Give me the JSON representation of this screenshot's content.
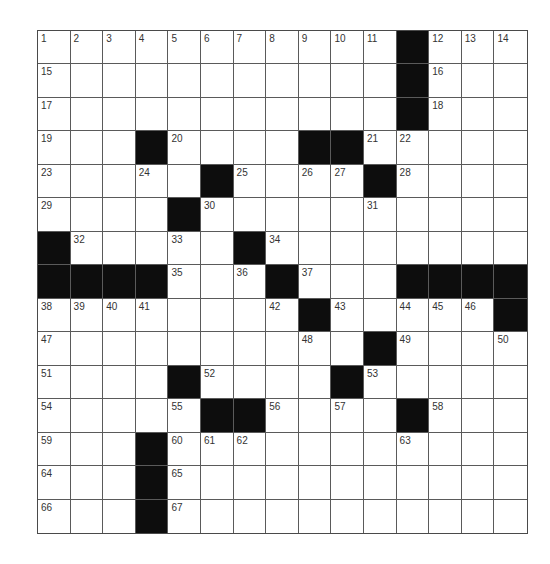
{
  "puzzle": {
    "rows": 15,
    "cols": 15,
    "colors": {
      "block": "#0d0d0d",
      "cell": "#ffffff",
      "line": "#5a5a5a",
      "number": "#333333"
    },
    "grid": [
      [
        "1",
        "2",
        "3",
        "4",
        "5",
        "6",
        "7",
        "8",
        "9",
        "10",
        "11",
        "#",
        "12",
        "13",
        "14"
      ],
      [
        "15",
        "",
        "",
        "",
        "",
        "",
        "",
        "",
        "",
        "",
        "",
        "#",
        "16",
        "",
        ""
      ],
      [
        "17",
        "",
        "",
        "",
        "",
        "",
        "",
        "",
        "",
        "",
        "",
        "#",
        "18",
        "",
        ""
      ],
      [
        "19",
        "",
        "",
        "#",
        "20",
        "",
        "",
        "",
        "#",
        "#",
        "21",
        "22",
        "",
        "",
        ""
      ],
      [
        "23",
        "",
        "",
        "24",
        "",
        "#",
        "25",
        "",
        "26",
        "27",
        "#",
        "28",
        "",
        "",
        ""
      ],
      [
        "29",
        "",
        "",
        "",
        "#",
        "30",
        "",
        "",
        "",
        "",
        "31",
        "",
        "",
        "",
        ""
      ],
      [
        "#",
        "32",
        "",
        "",
        "33",
        "",
        "#",
        "34",
        "",
        "",
        "",
        "",
        "",
        "",
        ""
      ],
      [
        "#",
        "#",
        "#",
        "#",
        "35",
        "",
        "36",
        "#",
        "37",
        "",
        "",
        "#",
        "#",
        "#",
        "#"
      ],
      [
        "38",
        "39",
        "40",
        "41",
        "",
        "",
        "",
        "42",
        "#",
        "43",
        "",
        "44",
        "45",
        "46",
        "#"
      ],
      [
        "47",
        "",
        "",
        "",
        "",
        "",
        "",
        "",
        "48",
        "",
        "#",
        "49",
        "",
        "",
        "50"
      ],
      [
        "51",
        "",
        "",
        "",
        "#",
        "52",
        "",
        "",
        "",
        "#",
        "53",
        "",
        "",
        "",
        ""
      ],
      [
        "54",
        "",
        "",
        "",
        "55",
        "#",
        "#",
        "56",
        "",
        "57",
        "",
        "#",
        "58",
        "",
        ""
      ],
      [
        "59",
        "",
        "",
        "#",
        "60",
        "61",
        "62",
        "",
        "",
        "",
        "",
        "63",
        "",
        "",
        ""
      ],
      [
        "64",
        "",
        "",
        "#",
        "65",
        "",
        "",
        "",
        "",
        "",
        "",
        "",
        "",
        "",
        ""
      ],
      [
        "66",
        "",
        "",
        "#",
        "67",
        "",
        "",
        "",
        "",
        "",
        "",
        "",
        "",
        "",
        ""
      ]
    ]
  }
}
